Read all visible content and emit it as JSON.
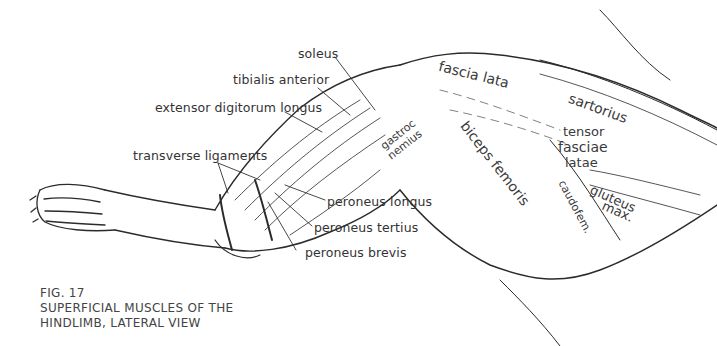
{
  "figure": {
    "number": "FIG. 17",
    "caption_line1": "SUPERFICIAL MUSCLES OF THE",
    "caption_line2": "HINDLIMB, LATERAL VIEW"
  },
  "labels": {
    "soleus": "soleus",
    "tibialis_anterior": "tibialis anterior",
    "extensor_digitorum_longus": "extensor digitorum longus",
    "transverse_ligaments": "transverse ligaments",
    "peroneus_longus": "peroneus longus",
    "peroneus_tertius": "peroneus tertius",
    "peroneus_brevis": "peroneus brevis"
  },
  "inline_labels": {
    "fascia_lata": "fascia lata",
    "sartorius": "sartorius",
    "biceps_femoris": "biceps femoris",
    "tensor": "tensor",
    "fasciae": "fasciae",
    "latae": "latae",
    "gluteus": "gluteus",
    "max": "max.",
    "caudofem": "caudofem.",
    "gastroc": "gastroc",
    "nemius": "nemius"
  }
}
